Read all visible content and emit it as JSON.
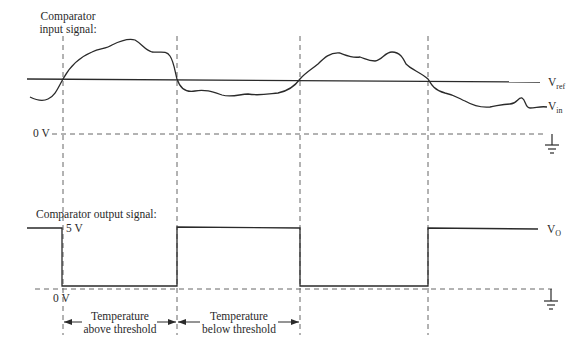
{
  "diagram": {
    "title_input": [
      "Comparator",
      "input signal:"
    ],
    "title_output": "Comparator output signal:",
    "vref_label": {
      "main": "V",
      "sub": "ref"
    },
    "vin_label": {
      "main": "V",
      "sub": "in"
    },
    "vo_label": {
      "main": "V",
      "sub": "O"
    },
    "input_zero_label": "0 V",
    "output_high_label": "5 V",
    "output_zero_label": "0 V",
    "interval_above": [
      "Temperature",
      "above threshold"
    ],
    "interval_below": [
      "Temperature",
      "below threshold"
    ],
    "output_levels_volts": {
      "high": 5,
      "low": 0
    },
    "output_sequence": [
      "high",
      "low",
      "high",
      "low",
      "high"
    ],
    "colors": {
      "line": "#2a2a2a",
      "dashed": "#555555"
    }
  }
}
